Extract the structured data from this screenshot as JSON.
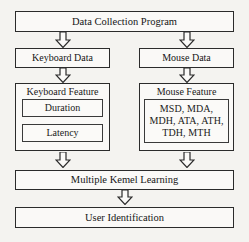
{
  "diagram": {
    "type": "flowchart",
    "background_color": "#f4f3f0",
    "line_color": "#2b2b2b",
    "box_fill": "#faf9f7",
    "nodes": {
      "data_collection": "Data Collection Program",
      "keyboard_data": "Keyboard Data",
      "mouse_data": "Mouse Data",
      "keyboard_feature": "Keyboard Feature",
      "keyboard_feature_items": [
        "Duration",
        "Latency"
      ],
      "mouse_feature": "Mouse Feature",
      "mouse_feature_items": "MSD, MDA, MDH, ATA, ATH, TDH, MTH",
      "multiple_kernel_learning": "Multiple Kemel Learning",
      "user_identification": "User Identification"
    },
    "arrows": [
      {
        "name": "arrow-collection-to-keyboard-data",
        "direction": "down"
      },
      {
        "name": "arrow-collection-to-mouse-data",
        "direction": "down"
      },
      {
        "name": "arrow-keyboard-data-to-keyboard-feature",
        "direction": "down"
      },
      {
        "name": "arrow-mouse-data-to-mouse-feature",
        "direction": "down"
      },
      {
        "name": "arrow-keyboard-feature-to-mkl",
        "direction": "down"
      },
      {
        "name": "arrow-mouse-feature-to-mkl",
        "direction": "down"
      },
      {
        "name": "arrow-mkl-to-user-identification",
        "direction": "down"
      }
    ]
  }
}
